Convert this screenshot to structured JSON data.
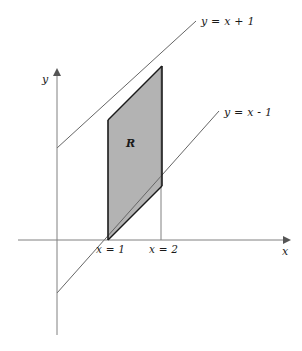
{
  "figure": {
    "type": "math-diagram",
    "title_visible": false,
    "background_color": "#ffffff",
    "width": 302,
    "height": 351
  },
  "axes": {
    "x_label": "x",
    "y_label": "y",
    "axis_color": "#808080",
    "origin_px": {
      "x": 57,
      "y": 240
    },
    "x_axis_px": {
      "x1": 18,
      "y1": 240,
      "x2": 288,
      "y2": 240
    },
    "y_axis_px": {
      "x1": 57,
      "y1": 70,
      "x2": 57,
      "y2": 335
    },
    "x_arrow": "right-arrowhead",
    "y_arrow": "up-arrowhead"
  },
  "lines": [
    {
      "id": "upper-line",
      "label": "y = x + 1",
      "equation_parts": {
        "lhs": "y",
        "rel": "=",
        "rhs": "x + 1"
      },
      "slope": 1,
      "intercept": 1,
      "color": "#666666",
      "px": {
        "x1": 57,
        "y1": 148,
        "x2": 196,
        "y2": 21
      },
      "label_px": {
        "x": 203,
        "y": 22
      }
    },
    {
      "id": "lower-line",
      "label": "y = x - 1",
      "equation_parts": {
        "lhs": "y",
        "rel": "=",
        "rhs": "x − 1"
      },
      "slope": 1,
      "intercept": -1,
      "color": "#666666",
      "px": {
        "x1": 57,
        "y1": 293,
        "x2": 219,
        "y2": 111
      },
      "label_px": {
        "x": 226,
        "y": 113
      }
    }
  ],
  "boundaries": [
    {
      "id": "x-equals-1",
      "label": "x = 1",
      "value": 1,
      "color": "#808080",
      "px": {
        "x": 108,
        "y_top": 120,
        "y_bottom": 240
      },
      "label_px": {
        "x": 97,
        "y": 245
      }
    },
    {
      "id": "x-equals-2",
      "label": "x = 2",
      "value": 2,
      "color": "#808080",
      "px": {
        "x": 161,
        "y_top": 66,
        "y_bottom": 240
      },
      "label_px": {
        "x": 150,
        "y": 245
      }
    }
  ],
  "region": {
    "label": "R",
    "fill_color": "#b3b3b3",
    "stroke_color": "#1a1a1a",
    "vertices_px": [
      {
        "x": 108,
        "y": 240
      },
      {
        "x": 162,
        "y": 186
      },
      {
        "x": 162,
        "y": 66
      },
      {
        "x": 108,
        "y": 120
      }
    ],
    "label_px": {
      "x": 129,
      "y": 143
    },
    "description": "Parallelogram bounded by y = x + 1 above, y = x - 1 below, x = 1 left, x = 2 right"
  },
  "chart_data": {
    "type": "line",
    "title": "",
    "xlabel": "x",
    "ylabel": "y",
    "grid": false,
    "legend": "inline-line-labels",
    "xlim": [
      -0.8,
      4.3
    ],
    "ylim": [
      -3.2,
      3.2
    ],
    "series": [
      {
        "name": "y = x + 1",
        "x": [
          0,
          2.6
        ],
        "values": [
          1,
          3.6
        ]
      },
      {
        "name": "y = x - 1",
        "x": [
          0,
          3.0
        ],
        "values": [
          -1,
          2.0
        ]
      }
    ],
    "annotations": [
      {
        "text": "R",
        "x": 1.4,
        "y": 1.4
      },
      {
        "text": "x = 1",
        "x": 1.0,
        "y": -0.35
      },
      {
        "text": "x = 2",
        "x": 2.0,
        "y": -0.35
      },
      {
        "text": "y = x + 1",
        "x": 2.8,
        "y": 3.7
      },
      {
        "text": "y = x - 1",
        "x": 3.2,
        "y": 2.1
      }
    ],
    "shaded_region": {
      "name": "R",
      "vertices": [
        {
          "x": 1,
          "y": 0
        },
        {
          "x": 2,
          "y": 1
        },
        {
          "x": 2,
          "y": 3
        },
        {
          "x": 1,
          "y": 2
        }
      ]
    }
  }
}
